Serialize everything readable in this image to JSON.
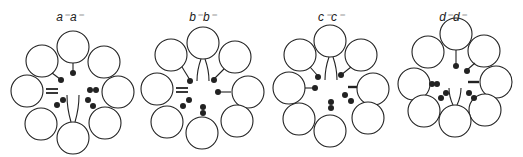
{
  "figure": {
    "background": "#ffffff",
    "stroke_color": "#222222",
    "panels": [
      {
        "id": "a",
        "label": "a⁻a⁻",
        "label_pos": [
          70,
          17
        ],
        "circle_radius": 16,
        "circles": [
          [
            73,
            47
          ],
          [
            42,
            61
          ],
          [
            104,
            62
          ],
          [
            27,
            91
          ],
          [
            118,
            92
          ],
          [
            41,
            124
          ],
          [
            105,
            123
          ],
          [
            73,
            138
          ]
        ],
        "stems": [
          [
            [
              73,
              63
            ],
            [
              73,
              72
            ]
          ],
          [
            [
              52,
              73
            ],
            [
              60,
              79
            ]
          ]
        ],
        "double_bars": [
          [
            [
              46,
              89
            ],
            [
              58,
              89
            ],
            [
              46,
              93
            ],
            [
              58,
              93
            ]
          ]
        ],
        "bars": [],
        "dots": [
          [
            73,
            73
          ],
          [
            61,
            80
          ],
          [
            90,
            90
          ],
          [
            96,
            90
          ],
          [
            63,
            100
          ],
          [
            57,
            105
          ],
          [
            88,
            100
          ],
          [
            93,
            106
          ]
        ],
        "forks": [
          {
            "base": [
              73,
              122
            ],
            "left_x": 67,
            "right_x": 79,
            "tip_y": 95,
            "dir": "up"
          }
        ]
      },
      {
        "id": "b",
        "label": "b⁻b⁻",
        "label_pos": [
          203,
          17
        ],
        "circle_radius": 16,
        "circles": [
          [
            203,
            43
          ],
          [
            171,
            55
          ],
          [
            235,
            57
          ],
          [
            157,
            89
          ],
          [
            248,
            92
          ],
          [
            167,
            122
          ],
          [
            237,
            121
          ],
          [
            202,
            133
          ]
        ],
        "stems": [
          [
            [
              182,
              67
            ],
            [
              190,
              80
            ]
          ],
          [
            [
              224,
              69
            ],
            [
              214,
              79
            ]
          ],
          [
            [
              231,
              92
            ],
            [
              219,
              92
            ]
          ]
        ],
        "double_bars": [
          [
            [
              176,
              88
            ],
            [
              188,
              88
            ],
            [
              176,
              92
            ],
            [
              188,
              92
            ]
          ]
        ],
        "bars": [],
        "dots": [
          [
            190,
            81
          ],
          [
            214,
            80
          ],
          [
            218,
            92
          ],
          [
            189,
            100
          ],
          [
            183,
            106
          ],
          [
            203,
            107
          ],
          [
            203,
            113
          ]
        ],
        "forks": [
          {
            "base": [
              203,
              59
            ],
            "left_x": 197,
            "right_x": 209,
            "tip_y": 81,
            "dir": "down"
          }
        ]
      },
      {
        "id": "c",
        "label": "c⁻c⁻",
        "label_pos": [
          331,
          17
        ],
        "circle_radius": 16,
        "circles": [
          [
            330,
            41
          ],
          [
            300,
            55
          ],
          [
            361,
            55
          ],
          [
            289,
            88
          ],
          [
            373,
            89
          ],
          [
            299,
            119
          ],
          [
            368,
            118
          ],
          [
            330,
            131
          ]
        ],
        "stems": [
          [
            [
              310,
              67
            ],
            [
              318,
              76
            ]
          ],
          [
            [
              351,
              67
            ],
            [
              341,
              75
            ]
          ],
          [
            [
              305,
              88
            ],
            [
              315,
              88
            ]
          ]
        ],
        "double_bars": [],
        "bars": [
          [
            [
              348,
              87
            ],
            [
              357,
              87
            ]
          ]
        ],
        "dots": [
          [
            318,
            77
          ],
          [
            341,
            75
          ],
          [
            315,
            88
          ],
          [
            345,
            95
          ],
          [
            351,
            101
          ],
          [
            331,
            102
          ],
          [
            331,
            108
          ]
        ],
        "forks": [
          {
            "base": [
              331,
              57
            ],
            "left_x": 325,
            "right_x": 337,
            "tip_y": 80,
            "dir": "down"
          }
        ]
      },
      {
        "id": "d",
        "label": "d⁻d⁻",
        "label_pos": [
          453,
          17
        ],
        "circle_radius": 16,
        "circles": [
          [
            456,
            34
          ],
          [
            428,
            52
          ],
          [
            484,
            51
          ],
          [
            414,
            84
          ],
          [
            496,
            82
          ],
          [
            424,
            111
          ],
          [
            485,
            110
          ],
          [
            455,
            121
          ]
        ],
        "stems": [
          [
            [
              456,
              50
            ],
            [
              456,
              65
            ]
          ],
          [
            [
              475,
              63
            ],
            [
              467,
              70
            ]
          ]
        ],
        "double_bars": [],
        "bars": [
          [
            [
              468,
              82
            ],
            [
              479,
              82
            ]
          ]
        ],
        "dots": [
          [
            456,
            66
          ],
          [
            467,
            71
          ],
          [
            432,
            84
          ],
          [
            437,
            84
          ],
          [
            446,
            93
          ],
          [
            441,
            98
          ],
          [
            469,
            93
          ],
          [
            474,
            98
          ]
        ],
        "forks": [
          {
            "base": [
              455,
              105
            ],
            "left_x": 449,
            "right_x": 461,
            "tip_y": 88,
            "dir": "up"
          }
        ]
      }
    ]
  }
}
